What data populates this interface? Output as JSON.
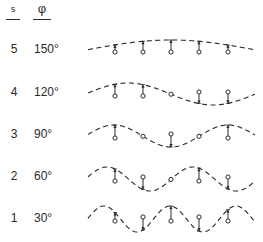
{
  "header": {
    "s_label": "s",
    "phi_label": "φ"
  },
  "rows": [
    {
      "s": "5",
      "phi": "150°",
      "y_label": 42
    },
    {
      "s": "4",
      "phi": "120°",
      "y_label": 85
    },
    {
      "s": "3",
      "phi": "90°",
      "y_label": 127
    },
    {
      "s": "2",
      "phi": "60°",
      "y_label": 169
    },
    {
      "s": "1",
      "phi": "30°",
      "y_label": 211
    }
  ],
  "waves": [
    {
      "s": 5,
      "center_y": 50,
      "amplitude": 10,
      "wavelength": 340,
      "peak_x": 171,
      "x_start": 88,
      "x_end": 255
    },
    {
      "s": 4,
      "center_y": 94,
      "amplitude": 11,
      "wavelength": 170,
      "peak_x": 128,
      "x_start": 88,
      "x_end": 255
    },
    {
      "s": 3,
      "center_y": 136,
      "amplitude": 11,
      "wavelength": 114,
      "peak_x": 114,
      "x_start": 88,
      "x_end": 255
    },
    {
      "s": 2,
      "center_y": 179,
      "amplitude": 12,
      "wavelength": 86,
      "peak_x": 107,
      "x_start": 88,
      "x_end": 255
    },
    {
      "s": 1,
      "center_y": 219,
      "amplitude": 13,
      "wavelength": 66,
      "peak_x": 104,
      "x_start": 88,
      "x_end": 255
    }
  ],
  "marker_x": [
    115,
    143,
    171,
    199,
    228
  ],
  "colors": {
    "ink": "#2a2a2a",
    "background": "#ffffff"
  }
}
